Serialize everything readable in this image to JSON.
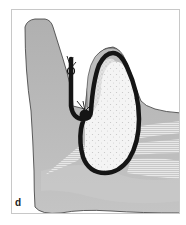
{
  "figure": {
    "panel_label": "d",
    "colors": {
      "tissue_gray": "#b4b4b4",
      "tissue_light": "#cfcfcf",
      "outline": "#3a3a3a",
      "black_band": "#151515",
      "speckled_core": "#f2f2f2",
      "frame_border": "#c8c8c8"
    }
  }
}
